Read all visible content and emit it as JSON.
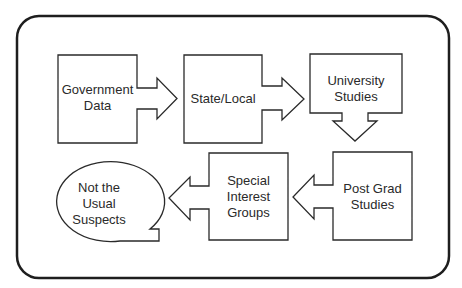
{
  "diagram": {
    "type": "flowchart",
    "colors": {
      "stroke": "#2a2a2a",
      "background": "#ffffff",
      "text": "#2a2a2a"
    },
    "nodes": [
      {
        "id": "government-data",
        "shape": "box-arrow-right",
        "lines": [
          "Government",
          "Data"
        ]
      },
      {
        "id": "state-local",
        "shape": "box-arrow-right",
        "lines": [
          "State/Local"
        ]
      },
      {
        "id": "university-studies",
        "shape": "box-arrow-down",
        "lines": [
          "University",
          "Studies"
        ]
      },
      {
        "id": "post-grad-studies",
        "shape": "box-arrow-left",
        "lines": [
          "Post Grad",
          "Studies"
        ]
      },
      {
        "id": "special-interest-groups",
        "shape": "box-arrow-left",
        "lines": [
          "Special",
          "Interest",
          "Groups"
        ]
      },
      {
        "id": "not-the-usual-suspects",
        "shape": "speech-bubble",
        "lines": [
          "Not the",
          "Usual",
          "Suspects"
        ]
      }
    ],
    "edges": [
      {
        "from": "government-data",
        "to": "state-local"
      },
      {
        "from": "state-local",
        "to": "university-studies"
      },
      {
        "from": "university-studies",
        "to": "post-grad-studies"
      },
      {
        "from": "post-grad-studies",
        "to": "special-interest-groups"
      },
      {
        "from": "special-interest-groups",
        "to": "not-the-usual-suspects"
      }
    ]
  }
}
